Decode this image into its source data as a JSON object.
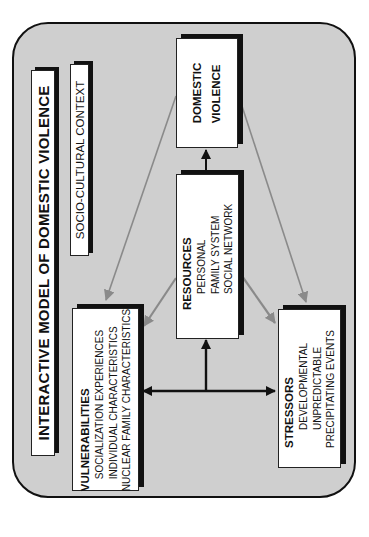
{
  "diagram": {
    "title": "INTERACTIVE MODEL OF DOMESTIC VIOLENCE",
    "context": "SOCIO-CULTURAL CONTEXT",
    "orientation": "rotated -90 degrees",
    "colors": {
      "background": "#cfcfcf",
      "box_fill": "#ffffff",
      "border": "#111111",
      "gray_arrow": "#8a8a8a",
      "black_arrow": "#111111"
    },
    "nodes": {
      "domestic_violence": {
        "line1": "DOMESTIC",
        "line2": "VIOLENCE"
      },
      "resources": {
        "heading": "RESOURCES",
        "items": [
          "PERSONAL",
          "FAMILY SYSTEM",
          "SOCIAL NETWORK"
        ]
      },
      "vulnerabilities": {
        "heading": "VULNERABILITIES",
        "items": [
          "SOCIALIZATION EXPERIENCES",
          "INDIVIDUAL CHARACTERISTICS",
          "NUCLEAR FAMILY CHARACTERISTICS"
        ]
      },
      "stressors": {
        "heading": "STRESSORS",
        "items": [
          "DEVELOPMENTAL",
          "UNPREDICTABLE",
          "PRECIPITATING EVENTS"
        ]
      }
    },
    "edges": [
      {
        "from": "resources",
        "to": "domestic_violence",
        "style": "black"
      },
      {
        "from": "junction",
        "to": "resources",
        "style": "black"
      },
      {
        "from": "junction",
        "to": "vulnerabilities",
        "style": "black"
      },
      {
        "from": "junction",
        "to": "stressors",
        "style": "black"
      },
      {
        "from": "domestic_violence",
        "to": "vulnerabilities",
        "style": "gray"
      },
      {
        "from": "domestic_violence",
        "to": "stressors",
        "style": "gray"
      },
      {
        "from": "resources",
        "to": "vulnerabilities",
        "style": "gray"
      },
      {
        "from": "resources",
        "to": "stressors",
        "style": "gray"
      }
    ]
  }
}
